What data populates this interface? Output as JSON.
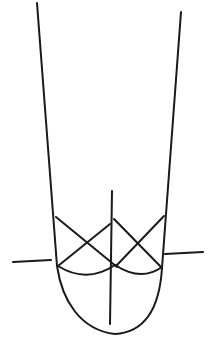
{
  "diagram": {
    "stroke_color": "#1a1a1a",
    "background_color": "#ffffff",
    "stroke_width": 2,
    "elements": {
      "tube_outline": "M37,3 L57,266 C62,300 80,330 115,334 C150,332 160,300 162,268 L181,12",
      "left_tick": [
        13,
        262,
        51,
        260
      ],
      "right_tick": [
        165,
        254,
        203,
        252
      ],
      "center_divider": [
        112,
        191,
        110,
        324
      ],
      "left_x_line_a": [
        56,
        217,
        117,
        267
      ],
      "left_x_line_b": [
        58,
        266,
        110,
        224
      ],
      "right_x_line_a": [
        114,
        219,
        162,
        268
      ],
      "right_x_line_b": [
        116,
        266,
        164,
        216
      ],
      "left_arc": "M58,266 Q87,284 115,265",
      "right_arc": "M115,265 Q141,282 162,267"
    }
  }
}
